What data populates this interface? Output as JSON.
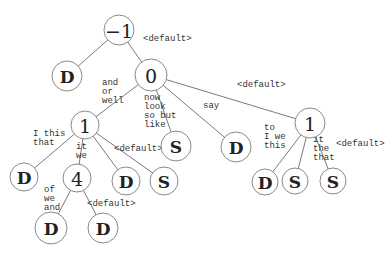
{
  "diagram": {
    "type": "decision-tree",
    "nodes": [
      {
        "id": "n_root",
        "label": "−1",
        "kind": "num",
        "x": 119,
        "y": 30,
        "r": 15
      },
      {
        "id": "n_D1",
        "label": "D",
        "kind": "leaf",
        "x": 67,
        "y": 76,
        "r": 15
      },
      {
        "id": "n_0",
        "label": "0",
        "kind": "num",
        "x": 151,
        "y": 75,
        "r": 16
      },
      {
        "id": "n_1a",
        "label": "1",
        "kind": "num",
        "x": 85,
        "y": 125,
        "r": 14
      },
      {
        "id": "n_S1",
        "label": "S",
        "kind": "leaf",
        "x": 176,
        "y": 146,
        "r": 15
      },
      {
        "id": "n_D2",
        "label": "D",
        "kind": "leaf",
        "x": 236,
        "y": 147,
        "r": 15
      },
      {
        "id": "n_1b",
        "label": "1",
        "kind": "num",
        "x": 310,
        "y": 123,
        "r": 15
      },
      {
        "id": "n_D3",
        "label": "D",
        "kind": "leaf",
        "x": 24,
        "y": 177,
        "r": 14
      },
      {
        "id": "n_4",
        "label": "4",
        "kind": "num",
        "x": 77,
        "y": 178,
        "r": 14
      },
      {
        "id": "n_D4",
        "label": "D",
        "kind": "leaf",
        "x": 126,
        "y": 181,
        "r": 14
      },
      {
        "id": "n_S2",
        "label": "S",
        "kind": "leaf",
        "x": 164,
        "y": 181,
        "r": 14
      },
      {
        "id": "n_D5",
        "label": "D",
        "kind": "leaf",
        "x": 51,
        "y": 228,
        "r": 16
      },
      {
        "id": "n_D6",
        "label": "D",
        "kind": "leaf",
        "x": 103,
        "y": 228,
        "r": 15
      },
      {
        "id": "n_D7",
        "label": "D",
        "kind": "leaf",
        "x": 265,
        "y": 182,
        "r": 13
      },
      {
        "id": "n_S3",
        "label": "S",
        "kind": "leaf",
        "x": 295,
        "y": 181,
        "r": 13
      },
      {
        "id": "n_S4",
        "label": "S",
        "kind": "leaf",
        "x": 333,
        "y": 181,
        "r": 13
      }
    ],
    "edges": [
      {
        "from": "n_root",
        "to": "n_D1",
        "label": []
      },
      {
        "from": "n_root",
        "to": "n_0",
        "label": [
          "<default>"
        ],
        "lx": 143,
        "ly": 41
      },
      {
        "from": "n_0",
        "to": "n_1a",
        "label": [
          "and",
          "or",
          "well"
        ],
        "lx": 102,
        "ly": 85
      },
      {
        "from": "n_0",
        "to": "n_S1",
        "label": [
          "now",
          "look",
          "so but",
          "like"
        ],
        "lx": 144,
        "ly": 100
      },
      {
        "from": "n_0",
        "to": "n_D2",
        "label": [
          "say"
        ],
        "lx": 203,
        "ly": 108
      },
      {
        "from": "n_0",
        "to": "n_1b",
        "label": [
          "<default>"
        ],
        "lx": 237,
        "ly": 87
      },
      {
        "from": "n_1a",
        "to": "n_D3",
        "label": [
          "I this",
          "that"
        ],
        "lx": 33,
        "ly": 136
      },
      {
        "from": "n_1a",
        "to": "n_4",
        "label": [
          "it",
          "we"
        ],
        "lx": 76,
        "ly": 149
      },
      {
        "from": "n_1a",
        "to": "n_D4",
        "label": [],
        "lx": 0,
        "ly": 0
      },
      {
        "from": "n_1a",
        "to": "n_S2",
        "label": [
          "<default>"
        ],
        "lx": 114,
        "ly": 151
      },
      {
        "from": "n_4",
        "to": "n_D5",
        "label": [
          "of",
          "we",
          "and"
        ],
        "lx": 44,
        "ly": 192
      },
      {
        "from": "n_4",
        "to": "n_D6",
        "label": [
          "<default>"
        ],
        "lx": 87,
        "ly": 206
      },
      {
        "from": "n_1b",
        "to": "n_D7",
        "label": [
          "to",
          "I we",
          "this"
        ],
        "lx": 264,
        "ly": 130
      },
      {
        "from": "n_1b",
        "to": "n_S3",
        "label": [
          "it",
          "the",
          "that"
        ],
        "lx": 313,
        "ly": 142
      },
      {
        "from": "n_1b",
        "to": "n_S4",
        "label": [
          "<default>"
        ],
        "lx": 336,
        "ly": 146
      }
    ],
    "colors": {
      "edge": "#7a7a7a",
      "node_border": "#8a8a8a",
      "text": "#222222",
      "background": "#ffffff"
    }
  }
}
